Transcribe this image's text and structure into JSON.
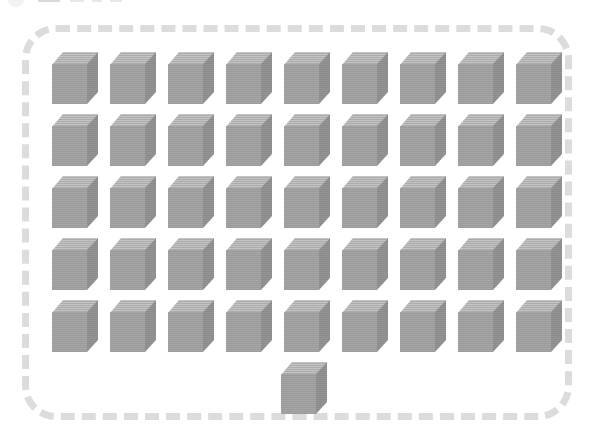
{
  "canvas": {
    "width": 595,
    "height": 441,
    "background_color": "#ffffff"
  },
  "clipped_header": {
    "description": "partially cut-off UI fragment at very top edge",
    "visible": true,
    "fragments": [
      "circle-fragment",
      "bar-fragment-1",
      "bar-fragment-2",
      "bar-fragment-3",
      "bar-fragment-4"
    ]
  },
  "board": {
    "border_style": "dashed",
    "border_color": "#dcdcdc",
    "border_width_px": 7,
    "corner_radius_px": 34,
    "fill_color": "#ffffff",
    "left": 22,
    "top": 25,
    "width": 550,
    "height": 395
  },
  "cube_style": {
    "top_face_color": "#ababab",
    "front_face_color": "#9b9b9b",
    "side_face_color": "#8b8b8b",
    "width_px": 46,
    "height_px": 52
  },
  "layout": {
    "grid_rows": 5,
    "grid_columns": 9,
    "column_pitch_px": 58,
    "row_pitch_px": 62,
    "grid_origin_x": 52,
    "grid_origin_y": 52,
    "extra_cube_x": 281,
    "extra_cube_y": 362
  },
  "chart_data": {
    "type": "bar",
    "title": "",
    "subtitle": "",
    "xlabel": "",
    "ylabel": "",
    "categories": [
      "Row 1",
      "Row 2",
      "Row 3",
      "Row 4",
      "Row 5",
      "Row 6"
    ],
    "values": [
      9,
      9,
      9,
      9,
      9,
      1
    ],
    "total_cubes": 46,
    "full_rows": 5,
    "cubes_per_full_row": 9,
    "remainder_cubes": 1,
    "unit_icon": "grey-isometric-cube",
    "legend": [],
    "annotations": [],
    "grid": false,
    "ylim": [
      0,
      9
    ]
  }
}
